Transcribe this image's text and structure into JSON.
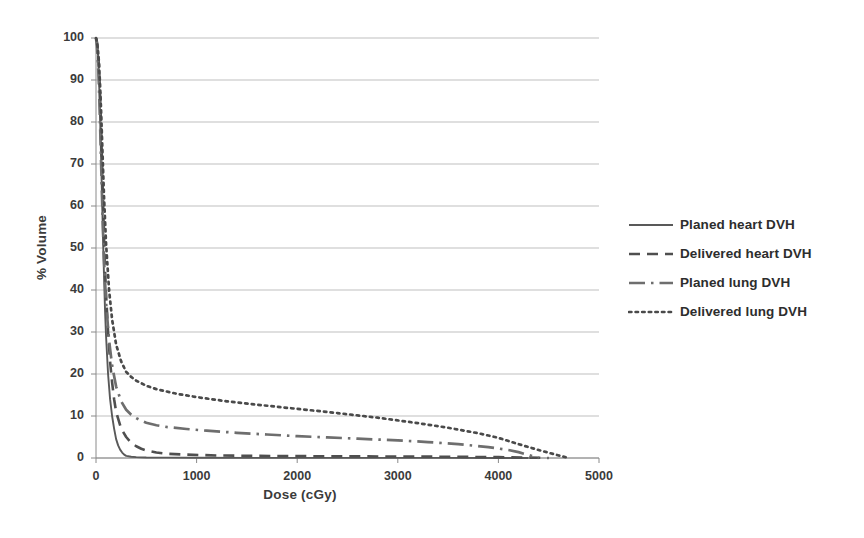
{
  "chart_data": {
    "type": "line",
    "title": "",
    "xlabel": "Dose (cGy)",
    "ylabel": "% Volume",
    "xlim": [
      0,
      5000
    ],
    "ylim": [
      0,
      100
    ],
    "xticks": [
      0,
      1000,
      2000,
      3000,
      4000,
      5000
    ],
    "yticks": [
      0,
      10,
      20,
      30,
      40,
      50,
      60,
      70,
      80,
      90,
      100
    ],
    "grid": "horizontal",
    "legend_position": "right",
    "series": [
      {
        "name": "Planed heart DVH",
        "style": "solid",
        "color": "#595959",
        "x": [
          0,
          10,
          20,
          30,
          40,
          50,
          60,
          70,
          80,
          90,
          100,
          120,
          140,
          160,
          180,
          200,
          220,
          240,
          260,
          280,
          300,
          350,
          400,
          500,
          700,
          1000,
          1500,
          2000,
          2500,
          3000,
          3500,
          4000,
          4300
        ],
        "y": [
          100,
          99,
          96,
          90,
          82,
          72,
          62,
          52,
          43,
          35,
          29,
          20,
          14,
          10,
          7,
          4.5,
          3,
          2,
          1.3,
          0.8,
          0.5,
          0.3,
          0.2,
          0.12,
          0.08,
          0.05,
          0.04,
          0.03,
          0.03,
          0.02,
          0.02,
          0.01,
          0
        ]
      },
      {
        "name": "Delivered heart DVH",
        "style": "dashed",
        "color": "#4f4f4f",
        "x": [
          0,
          10,
          20,
          30,
          40,
          50,
          60,
          70,
          80,
          90,
          100,
          120,
          140,
          160,
          180,
          200,
          250,
          300,
          350,
          400,
          450,
          500,
          600,
          700,
          900,
          1200,
          1600,
          2000,
          2500,
          3000,
          3500,
          4000,
          4300,
          4500
        ],
        "y": [
          100,
          99,
          97,
          93,
          87,
          79,
          70,
          61,
          52,
          45,
          39,
          30,
          23,
          18,
          14,
          11,
          7,
          5,
          3.6,
          2.8,
          2.2,
          1.8,
          1.3,
          1.0,
          0.8,
          0.6,
          0.5,
          0.45,
          0.4,
          0.35,
          0.3,
          0.2,
          0.1,
          0
        ]
      },
      {
        "name": "Planed lung DVH",
        "style": "dashdot",
        "color": "#6e6e6e",
        "x": [
          0,
          10,
          20,
          30,
          40,
          50,
          60,
          70,
          80,
          100,
          130,
          160,
          200,
          250,
          300,
          350,
          400,
          450,
          500,
          600,
          700,
          900,
          1100,
          1400,
          1700,
          2000,
          2300,
          2600,
          3000,
          3300,
          3600,
          3900,
          4100,
          4200,
          4300,
          4400
        ],
        "y": [
          100,
          98,
          94,
          88,
          80,
          71,
          62,
          54,
          47,
          37,
          28,
          22,
          17,
          13.5,
          11.5,
          10.3,
          9.5,
          8.9,
          8.4,
          7.8,
          7.4,
          6.9,
          6.5,
          6.0,
          5.6,
          5.2,
          4.9,
          4.6,
          4.2,
          3.8,
          3.3,
          2.6,
          1.9,
          1.4,
          0.7,
          0
        ]
      },
      {
        "name": "Delivered lung DVH",
        "style": "dotted",
        "color": "#4a4a4a",
        "x": [
          0,
          10,
          20,
          30,
          40,
          50,
          60,
          70,
          80,
          100,
          130,
          160,
          200,
          250,
          300,
          350,
          400,
          500,
          600,
          800,
          1000,
          1300,
          1600,
          2000,
          2400,
          2800,
          3200,
          3500,
          3800,
          4000,
          4200,
          4400,
          4600,
          4700
        ],
        "y": [
          100,
          99,
          97,
          94,
          89,
          83,
          76,
          69,
          62,
          51,
          40,
          33,
          27,
          23,
          20.5,
          19.3,
          18.4,
          17.2,
          16.4,
          15.3,
          14.5,
          13.5,
          12.7,
          11.7,
          10.7,
          9.6,
          8.3,
          7.2,
          5.9,
          4.8,
          3.3,
          1.9,
          0.6,
          0
        ]
      }
    ]
  },
  "legend": {
    "items": [
      {
        "label": "Planed heart DVH",
        "key": "solid-line-key"
      },
      {
        "label": "Delivered heart DVH",
        "key": "dashed-line-key"
      },
      {
        "label": "Planed lung DVH",
        "key": "dashdot-line-key"
      },
      {
        "label": "Delivered lung DVH",
        "key": "dotted-line-key"
      }
    ]
  },
  "axes": {
    "x_title": "Dose (cGy)",
    "y_title": "% Volume",
    "x_tick_labels": [
      "0",
      "1000",
      "2000",
      "3000",
      "4000",
      "5000"
    ],
    "y_tick_labels": [
      "0",
      "10",
      "20",
      "30",
      "40",
      "50",
      "60",
      "70",
      "80",
      "90",
      "100"
    ]
  },
  "colors": {
    "grid": "#b8b8b8",
    "axis": "#8a8a8a",
    "text": "#3b3b3b",
    "background": "#ffffff"
  }
}
